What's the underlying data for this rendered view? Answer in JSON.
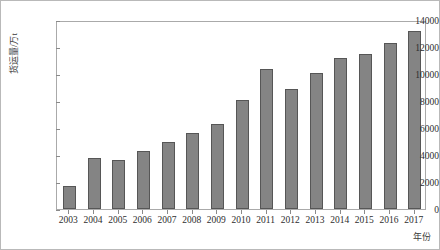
{
  "chart_data": {
    "type": "bar",
    "title": "",
    "xlabel": "年份",
    "ylabel": "货运量/万t",
    "categories": [
      "2003",
      "2004",
      "2005",
      "2006",
      "2007",
      "2008",
      "2009",
      "2010",
      "2011",
      "2012",
      "2013",
      "2014",
      "2015",
      "2016",
      "2017"
    ],
    "values": [
      1700,
      3800,
      3650,
      4300,
      5000,
      5650,
      6300,
      8070,
      10370,
      8900,
      10100,
      11200,
      11450,
      12300,
      13200
    ],
    "ylim": [
      0,
      14000
    ],
    "yticks": [
      0,
      2000,
      4000,
      6000,
      8000,
      10000,
      12000,
      14000
    ],
    "ytick_labels": [
      "0",
      "2000",
      "4000",
      "6000",
      "8000",
      "10000",
      "12000",
      "14000"
    ],
    "grid": false,
    "legend": null,
    "bar_color": "#848484",
    "bar_border_color": "#565656",
    "frame_color": "#aaaaaa",
    "background": "#ffffff"
  }
}
